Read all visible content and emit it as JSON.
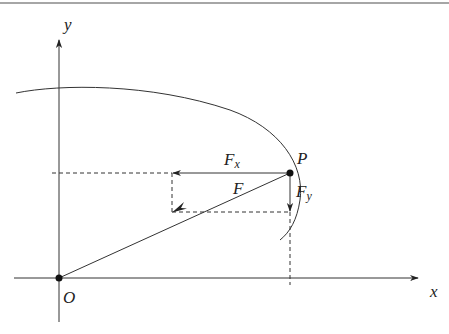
{
  "diagram": {
    "type": "force-decomposition",
    "labels": {
      "y_axis": "y",
      "x_axis": "x",
      "origin": "O",
      "point": "P",
      "force": "F",
      "fx_main": "F",
      "fx_sub": "x",
      "fy_main": "F",
      "fy_sub": "y"
    },
    "colors": {
      "line": "#333333",
      "rule": "#888888",
      "background": "#ffffff"
    }
  }
}
